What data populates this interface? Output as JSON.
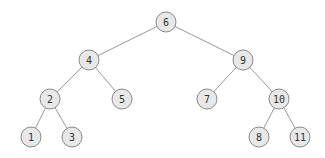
{
  "diagram": {
    "type": "binary-search-tree",
    "colors": {
      "node_fill": "#e8e8e8",
      "node_stroke": "#8a8a8a",
      "edge": "#999999",
      "label": "#333333"
    },
    "node_radius": 10,
    "nodes": [
      {
        "id": "n6",
        "label": "6",
        "x": 166,
        "y": 22
      },
      {
        "id": "n4",
        "label": "4",
        "x": 89,
        "y": 60
      },
      {
        "id": "n9",
        "label": "9",
        "x": 243,
        "y": 60
      },
      {
        "id": "n2",
        "label": "2",
        "x": 50,
        "y": 99
      },
      {
        "id": "n5",
        "label": "5",
        "x": 122,
        "y": 99
      },
      {
        "id": "n7",
        "label": "7",
        "x": 207,
        "y": 99
      },
      {
        "id": "n10",
        "label": "10",
        "x": 279,
        "y": 99
      },
      {
        "id": "n1",
        "label": "1",
        "x": 31,
        "y": 137
      },
      {
        "id": "n3",
        "label": "3",
        "x": 72,
        "y": 137
      },
      {
        "id": "n8",
        "label": "8",
        "x": 259,
        "y": 137
      },
      {
        "id": "n11",
        "label": "11",
        "x": 300,
        "y": 137
      }
    ],
    "edges": [
      {
        "from": "n6",
        "to": "n4"
      },
      {
        "from": "n6",
        "to": "n9"
      },
      {
        "from": "n4",
        "to": "n2"
      },
      {
        "from": "n4",
        "to": "n5"
      },
      {
        "from": "n9",
        "to": "n7"
      },
      {
        "from": "n9",
        "to": "n10"
      },
      {
        "from": "n2",
        "to": "n1"
      },
      {
        "from": "n2",
        "to": "n3"
      },
      {
        "from": "n10",
        "to": "n8"
      },
      {
        "from": "n10",
        "to": "n11"
      }
    ]
  }
}
